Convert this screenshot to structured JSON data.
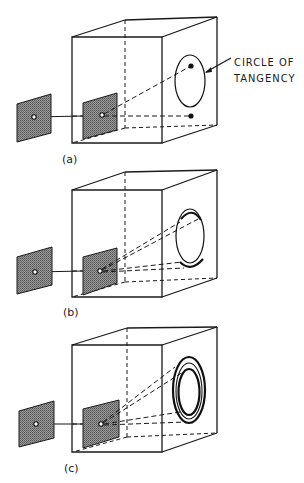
{
  "figure": {
    "annotation": {
      "line1": "CIRCLE OF",
      "line2": "TANGENCY"
    },
    "panels": [
      {
        "id": "a",
        "caption": "(a)",
        "pattern": "single circle with two spots"
      },
      {
        "id": "b",
        "caption": "(b)",
        "pattern": "circle with two partial arcs"
      },
      {
        "id": "c",
        "caption": "(c)",
        "pattern": "concentric rings"
      }
    ],
    "colors": {
      "ink": "#1a1a1a",
      "plate_fill": "#8c8c8c",
      "background": "#ffffff"
    }
  }
}
